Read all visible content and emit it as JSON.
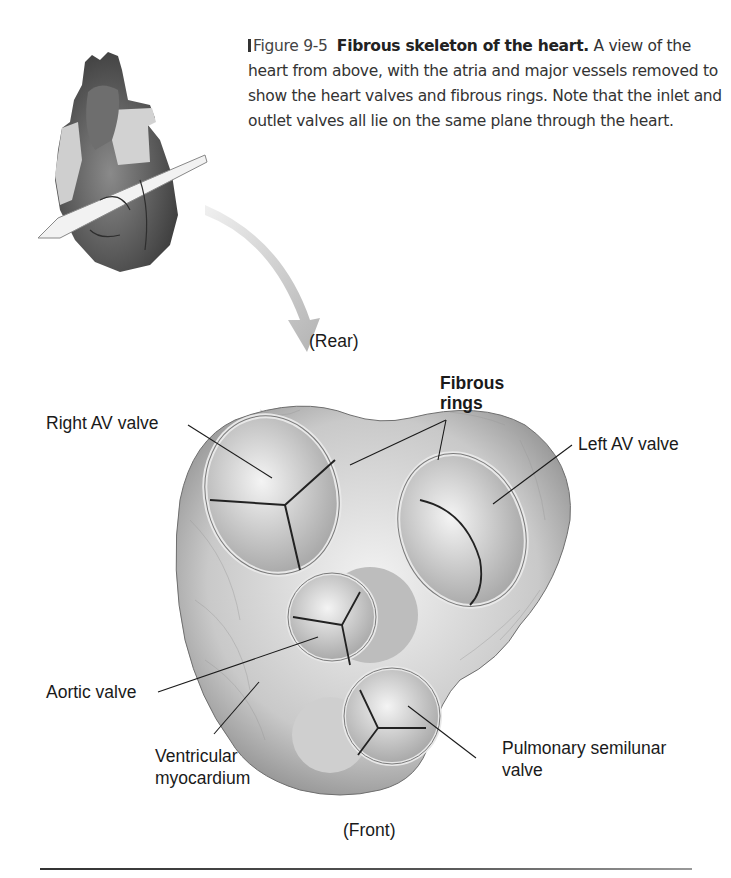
{
  "figure": {
    "number": "Figure 9-5",
    "title": "Fibrous skeleton of the heart.",
    "caption": "A view of the heart from above, with the atria and major vessels removed to show the heart valves and fibrous rings. Note that the inlet and outlet valves all lie on the same plane through the heart."
  },
  "orientation": {
    "rear": "(Rear)",
    "front": "(Front)"
  },
  "labels": {
    "right_av_valve": "Right AV valve",
    "fibrous_rings_line1": "Fibrous",
    "fibrous_rings_line2": "rings",
    "left_av_valve": "Left AV valve",
    "aortic_valve": "Aortic valve",
    "ventricular_line1": "Ventricular",
    "ventricular_line2": "myocardium",
    "pulmonary_line1": "Pulmonary semilunar",
    "pulmonary_line2": "valve"
  },
  "colors": {
    "background": "#ffffff",
    "text": "#1a1a1a",
    "tissue": "#c8c8c8",
    "ring": "#e6e6e6",
    "arrow": "#bdbdbd"
  }
}
